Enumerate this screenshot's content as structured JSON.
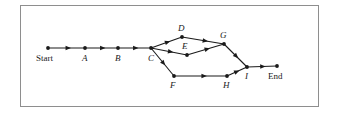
{
  "figure": {
    "type": "directed-graph-diagram",
    "border_color": "#8e8e8e",
    "line_color": "#1a1a1a",
    "background": "#ffffff"
  },
  "nodes": [
    {
      "id": "start",
      "label": "Start",
      "x": 48,
      "y": 48,
      "label_x": 36,
      "label_y": 54,
      "italic": false
    },
    {
      "id": "a",
      "label": "A",
      "x": 85,
      "y": 48,
      "label_x": 82,
      "label_y": 54,
      "italic": true
    },
    {
      "id": "b",
      "label": "B",
      "x": 118,
      "y": 48,
      "label_x": 115,
      "label_y": 54,
      "italic": true
    },
    {
      "id": "c",
      "label": "C",
      "x": 151,
      "y": 48,
      "label_x": 148,
      "label_y": 54,
      "italic": true
    },
    {
      "id": "d",
      "label": "D",
      "x": 182,
      "y": 37,
      "label_x": 178,
      "label_y": 24,
      "italic": true
    },
    {
      "id": "e",
      "label": "E",
      "x": 187,
      "y": 55,
      "label_x": 182,
      "label_y": 42,
      "italic": true
    },
    {
      "id": "f",
      "label": "F",
      "x": 174,
      "y": 76,
      "label_x": 170,
      "label_y": 81,
      "italic": true
    },
    {
      "id": "g",
      "label": "G",
      "x": 224,
      "y": 44,
      "label_x": 220,
      "label_y": 31,
      "italic": true
    },
    {
      "id": "h",
      "label": "H",
      "x": 227,
      "y": 76,
      "label_x": 223,
      "label_y": 81,
      "italic": true
    },
    {
      "id": "i",
      "label": "I",
      "x": 247,
      "y": 67,
      "label_x": 245,
      "label_y": 72,
      "italic": true
    },
    {
      "id": "end",
      "label": "End",
      "x": 277,
      "y": 66,
      "label_x": 268,
      "label_y": 72,
      "italic": false
    }
  ],
  "edges": [
    {
      "from": "start",
      "to": "a"
    },
    {
      "from": "a",
      "to": "b"
    },
    {
      "from": "b",
      "to": "c"
    },
    {
      "from": "c",
      "to": "d"
    },
    {
      "from": "c",
      "to": "e"
    },
    {
      "from": "c",
      "to": "f"
    },
    {
      "from": "d",
      "to": "g"
    },
    {
      "from": "e",
      "to": "g"
    },
    {
      "from": "g",
      "to": "i"
    },
    {
      "from": "f",
      "to": "h"
    },
    {
      "from": "h",
      "to": "i"
    },
    {
      "from": "i",
      "to": "end"
    }
  ]
}
